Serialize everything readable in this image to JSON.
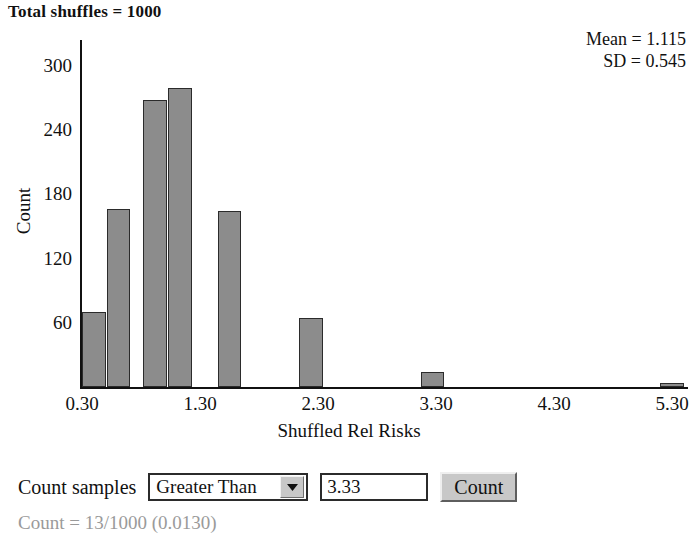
{
  "title": "Total shuffles = 1000",
  "stats": {
    "mean_line": "Mean = 1.115",
    "sd_line": "SD = 0.545"
  },
  "controls": {
    "count_samples_label": "Count samples",
    "condition_selected": "Greater Than",
    "condition_options": [
      "Greater Than"
    ],
    "threshold_value": "3.33",
    "count_button_label": "Count",
    "result_text": "Count = 13/1000 (0.0130)",
    "dropdown_arrow_icon": "chevron-down-icon"
  },
  "chart_data": {
    "type": "bar",
    "title": "Total shuffles = 1000",
    "xlabel": "Shuffled Rel Risks",
    "ylabel": "Count",
    "xtick_labels": [
      "0.30",
      "1.30",
      "2.30",
      "3.30",
      "4.30",
      "5.30"
    ],
    "xtick_values": [
      0.3,
      1.3,
      2.3,
      3.3,
      4.3,
      5.3
    ],
    "ytick_labels": [
      "60",
      "120",
      "180",
      "240",
      "300"
    ],
    "ytick_values": [
      60,
      120,
      180,
      240,
      300
    ],
    "xlim": [
      0.25,
      5.45
    ],
    "ylim": [
      0,
      320
    ],
    "grid": false,
    "legend": null,
    "bin_width": 0.2,
    "bars": [
      {
        "x_left": 0.3,
        "value": 70
      },
      {
        "x_left": 0.51,
        "value": 166
      },
      {
        "x_left": 0.82,
        "value": 268
      },
      {
        "x_left": 1.03,
        "value": 279
      },
      {
        "x_left": 1.45,
        "value": 164
      },
      {
        "x_left": 2.14,
        "value": 64
      },
      {
        "x_left": 3.17,
        "value": 14
      },
      {
        "x_left": 5.2,
        "value": 4
      }
    ],
    "summary": {
      "total_shuffles": 1000,
      "mean": 1.115,
      "sd": 0.545,
      "count_matching": 13,
      "proportion": 0.013
    }
  }
}
